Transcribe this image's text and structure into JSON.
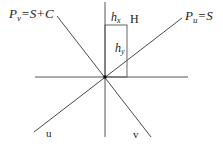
{
  "diagram": {
    "labels": {
      "pv_left": "P",
      "pv_sub": "v",
      "pv_rest": "=S+C",
      "pu_left": "P",
      "pu_sub": "u",
      "pu_rest": "=S",
      "hx_main": "h",
      "hx_sub": "x",
      "hy_main": "h",
      "hy_sub": "y",
      "H": "H",
      "u": "u",
      "v": "v"
    },
    "colors": {
      "line": "#333333",
      "rect": "#555555",
      "text": "#222222"
    }
  }
}
